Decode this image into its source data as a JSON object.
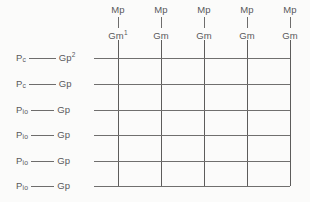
{
  "diagram": {
    "background_color": "#fbfbfa",
    "line_color": "#6e6d6c",
    "text_color": "#58585a"
  },
  "columns": [
    {
      "top_label": "Mp",
      "bottom_label": "Gm",
      "bottom_superscript": "1",
      "x": 118
    },
    {
      "top_label": "Mp",
      "bottom_label": "Gm",
      "bottom_superscript": "",
      "x": 161
    },
    {
      "top_label": "Mp",
      "bottom_label": "Gm",
      "bottom_superscript": "",
      "x": 204
    },
    {
      "top_label": "Mp",
      "bottom_label": "Gm",
      "bottom_superscript": "",
      "x": 247
    },
    {
      "top_label": "Mp",
      "bottom_label": "Gm",
      "bottom_superscript": "",
      "x": 290
    }
  ],
  "rows": [
    {
      "left_label": "P",
      "left_subscript": "c",
      "right_label": "Gp",
      "right_superscript": "2",
      "y": 58
    },
    {
      "left_label": "P",
      "left_subscript": "c",
      "right_label": "Gp",
      "right_superscript": "",
      "y": 84
    },
    {
      "left_label": "P",
      "left_subscript": "io",
      "right_label": "Gp",
      "right_superscript": "",
      "y": 110
    },
    {
      "left_label": "P",
      "left_subscript": "io",
      "right_label": "Gp",
      "right_superscript": "",
      "y": 135
    },
    {
      "left_label": "P",
      "left_subscript": "io",
      "right_label": "Gp",
      "right_superscript": "",
      "y": 161
    },
    {
      "left_label": "P",
      "left_subscript": "io",
      "right_label": "Gp",
      "right_superscript": "",
      "y": 186
    }
  ],
  "geometry": {
    "row_line_left_x": 14,
    "row_line_right_x": 290,
    "col_line_top_y": 40,
    "col_line_bottom_y": 186,
    "row_label_left_x": 16,
    "row_connector_width": 30,
    "col_head_top_y": 4
  }
}
